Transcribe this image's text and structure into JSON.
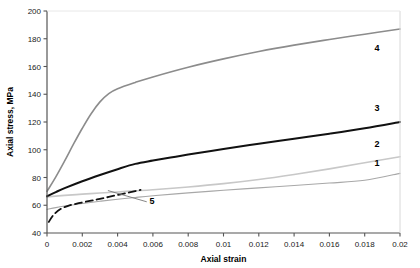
{
  "chart_data": {
    "type": "line",
    "title": "",
    "xlabel": "Axial strain",
    "ylabel": "Axial stress, MPa",
    "xlim": [
      0,
      0.02
    ],
    "ylim": [
      40,
      200
    ],
    "grid": false,
    "legend": "inline-end-labels",
    "xticks": [
      "0",
      "0.002",
      "0.004",
      "0.006",
      "0.008",
      "0.01",
      "0.012",
      "0.014",
      "0.016",
      "0.018",
      "0.02"
    ],
    "xtick_values": [
      0,
      0.002,
      0.004,
      0.006,
      0.008,
      0.01,
      0.012,
      0.014,
      0.016,
      0.018,
      0.02
    ],
    "yticks": [
      "40",
      "60",
      "80",
      "100",
      "120",
      "140",
      "160",
      "180",
      "200"
    ],
    "ytick_values": [
      40,
      60,
      80,
      100,
      120,
      140,
      160,
      180,
      200
    ],
    "series": [
      {
        "name": "1",
        "label": "1",
        "color": "#a8a8a8",
        "style": "solid",
        "width": 1.1,
        "label_pos": {
          "x": 0.0187,
          "y": 88
        },
        "x": [
          0,
          0.0005,
          0.001,
          0.002,
          0.003,
          0.004,
          0.005,
          0.006,
          0.008,
          0.01,
          0.012,
          0.014,
          0.016,
          0.018,
          0.02
        ],
        "y": [
          57.0,
          58.3,
          59.4,
          61.3,
          62.9,
          64.3,
          65.6,
          66.8,
          68.9,
          70.8,
          72.5,
          74.2,
          76.0,
          78.0,
          83.0
        ]
      },
      {
        "name": "2",
        "label": "2",
        "color": "#c8c8c8",
        "style": "solid",
        "width": 1.6,
        "label_pos": {
          "x": 0.0187,
          "y": 102
        },
        "x": [
          0,
          0.0005,
          0.001,
          0.002,
          0.003,
          0.004,
          0.005,
          0.006,
          0.008,
          0.01,
          0.012,
          0.014,
          0.016,
          0.018,
          0.02
        ],
        "y": [
          66.0,
          66.6,
          67.1,
          68.0,
          68.8,
          69.6,
          70.4,
          71.2,
          73.2,
          75.6,
          78.6,
          82.2,
          86.2,
          90.6,
          95.0
        ]
      },
      {
        "name": "3",
        "label": "3",
        "color": "#111111",
        "style": "solid",
        "width": 2.0,
        "label_pos": {
          "x": 0.0187,
          "y": 128
        },
        "x": [
          0,
          0.0005,
          0.001,
          0.002,
          0.003,
          0.004,
          0.005,
          0.006,
          0.007,
          0.008,
          0.01,
          0.012,
          0.014,
          0.016,
          0.018,
          0.02
        ],
        "y": [
          66.5,
          69.5,
          72.3,
          77.3,
          81.8,
          86.0,
          89.8,
          92.2,
          94.4,
          96.5,
          100.6,
          104.4,
          108.0,
          111.6,
          115.5,
          120.0
        ]
      },
      {
        "name": "4",
        "label": "4",
        "color": "#8c8c8c",
        "style": "solid",
        "width": 1.6,
        "label_pos": {
          "x": 0.0187,
          "y": 171
        },
        "x": [
          0,
          0.0005,
          0.001,
          0.0015,
          0.002,
          0.0025,
          0.003,
          0.0035,
          0.004,
          0.005,
          0.006,
          0.008,
          0.01,
          0.012,
          0.014,
          0.016,
          0.018,
          0.02
        ],
        "y": [
          70.0,
          80.5,
          92.0,
          104.0,
          115.5,
          126.0,
          134.5,
          140.5,
          144.0,
          148.5,
          152.5,
          159.5,
          165.5,
          170.8,
          175.4,
          179.5,
          183.3,
          187.0
        ]
      },
      {
        "name": "5",
        "label": "5",
        "color": "#111111",
        "style": "dashed",
        "width": 1.8,
        "label_pos": {
          "x": 0.00595,
          "y": 61
        },
        "x": [
          0.0001,
          0.0004,
          0.0008,
          0.0012,
          0.0018,
          0.0025,
          0.003,
          0.0035,
          0.004,
          0.0045,
          0.005,
          0.0053
        ],
        "y": [
          48.0,
          53.5,
          57.5,
          59.6,
          61.5,
          63.3,
          64.6,
          66.0,
          67.4,
          68.8,
          70.2,
          71.0
        ]
      }
    ],
    "leader_line": {
      "from": {
        "x": 0.00565,
        "y": 62.5
      },
      "to": {
        "x": 0.00345,
        "y": 70.6
      }
    }
  }
}
